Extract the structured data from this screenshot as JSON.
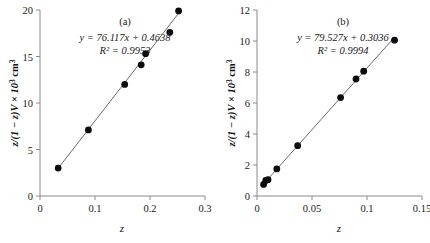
{
  "figure": {
    "panel_count": 2,
    "background": "#ffffff",
    "marker_color": "#0d0d0d",
    "line_color": "#6b6b6b",
    "axis_color": "#8a8a8a"
  },
  "chart_data": [
    {
      "type": "scatter",
      "panel_label": "(a)",
      "title": "",
      "xlabel": "z",
      "ylabel": "z/(1 − z)V × 10³ cm³",
      "ylabel_parts": {
        "lead": "z/(1 − z)V × 10",
        "exponent": "3",
        "unit": " cm",
        "unit_exponent": "3"
      },
      "xlim": [
        0,
        0.3
      ],
      "ylim": [
        0,
        20
      ],
      "xticks": [
        0,
        0.1,
        0.2,
        0.3
      ],
      "xtick_labels": [
        "0",
        "0.1",
        "0.2",
        "0.3"
      ],
      "yticks": [
        0,
        5,
        10,
        15,
        20
      ],
      "ytick_labels": [
        "0",
        "5",
        "10",
        "15",
        "20"
      ],
      "grid": false,
      "legend": false,
      "annotations": [
        {
          "name": "regression-equation",
          "text": "y = 76.117x + 0.4638"
        },
        {
          "name": "r-squared",
          "text": "R² = 0.9953"
        }
      ],
      "fit": {
        "slope": 76.117,
        "intercept": 0.4638,
        "r_squared": 0.9953,
        "equation": "y = 76.117x + 0.4638",
        "r_squared_text": "R² = 0.9953"
      },
      "x": [
        0.033,
        0.088,
        0.154,
        0.184,
        0.192,
        0.236,
        0.252
      ],
      "y": [
        3.0,
        7.1,
        12.0,
        14.1,
        15.3,
        17.6,
        19.9
      ]
    },
    {
      "type": "scatter",
      "panel_label": "(b)",
      "title": "",
      "xlabel": "z",
      "ylabel": "z/(1 − z)V × 10³ cm³",
      "ylabel_parts": {
        "lead": "z/(1 − z)V × 10",
        "exponent": "3",
        "unit": " cm",
        "unit_exponent": "3"
      },
      "xlim": [
        0,
        0.15
      ],
      "ylim": [
        0,
        12
      ],
      "xticks": [
        0,
        0.05,
        0.1,
        0.15
      ],
      "xtick_labels": [
        "0",
        "0.05",
        "0.1",
        "0.15"
      ],
      "yticks": [
        0,
        2,
        4,
        6,
        8,
        10,
        12
      ],
      "ytick_labels": [
        "0",
        "2",
        "4",
        "6",
        "8",
        "10",
        "12"
      ],
      "grid": false,
      "legend": false,
      "annotations": [
        {
          "name": "regression-equation",
          "text": "y = 79.527x + 0.3036"
        },
        {
          "name": "r-squared",
          "text": "R² = 0.9994"
        }
      ],
      "fit": {
        "slope": 79.527,
        "intercept": 0.3036,
        "r_squared": 0.9994,
        "equation": "y = 79.527x + 0.3036",
        "r_squared_text": "R² = 0.9994"
      },
      "x": [
        0.006,
        0.008,
        0.01,
        0.018,
        0.037,
        0.076,
        0.09,
        0.097,
        0.125
      ],
      "y": [
        0.75,
        1.0,
        1.05,
        1.75,
        3.25,
        6.35,
        7.55,
        8.05,
        10.05
      ]
    }
  ]
}
